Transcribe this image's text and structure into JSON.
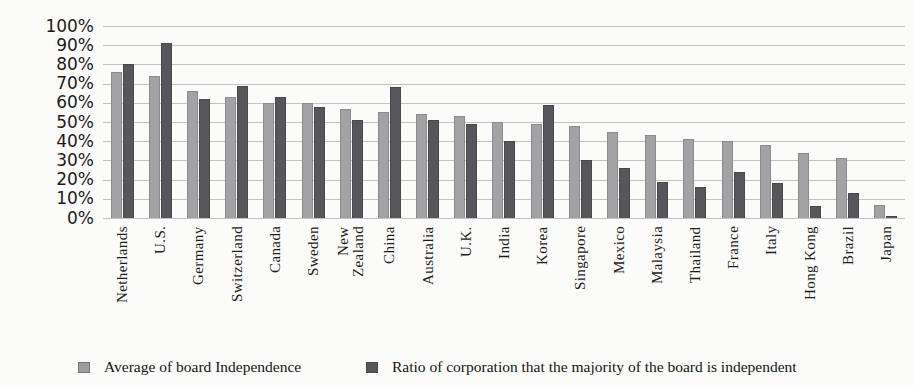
{
  "chart_data": {
    "type": "bar",
    "title": "",
    "xlabel": "",
    "ylabel": "",
    "ylim": [
      0,
      100
    ],
    "grid": "horizontal",
    "legend_position": "bottom",
    "yticks": [
      {
        "v": 0,
        "label": "0%"
      },
      {
        "v": 10,
        "label": "10%"
      },
      {
        "v": 20,
        "label": "20%"
      },
      {
        "v": 30,
        "label": "30%"
      },
      {
        "v": 40,
        "label": "40%"
      },
      {
        "v": 50,
        "label": "50%"
      },
      {
        "v": 60,
        "label": "60%"
      },
      {
        "v": 70,
        "label": "70%"
      },
      {
        "v": 80,
        "label": "80%"
      },
      {
        "v": 90,
        "label": "90%"
      },
      {
        "v": 100,
        "label": "100%"
      }
    ],
    "categories": [
      "Netherlands",
      "U.S.",
      "Germany",
      "Switzerland",
      "Canada",
      "Sweden",
      "New\nZealand",
      "China",
      "Australia",
      "U.K.",
      "India",
      "Korea",
      "Singapore",
      "Mexico",
      "Malaysia",
      "Thailand",
      "France",
      "Italy",
      "Hong Kong",
      "Brazil",
      "Japan"
    ],
    "series": [
      {
        "name": "Average of board Independence",
        "color": "#a3a3a6",
        "values": [
          76,
          74,
          66,
          63,
          60,
          60,
          57,
          55,
          54,
          53,
          50,
          49,
          48,
          45,
          43,
          41,
          40,
          38,
          34,
          31,
          7
        ]
      },
      {
        "name": "Ratio of corporation that the majority of the board is independent",
        "color": "#57575b",
        "values": [
          80,
          91,
          62,
          69,
          63,
          58,
          51,
          68,
          51,
          49,
          40,
          59,
          30,
          26,
          19,
          16,
          24,
          18,
          6,
          13,
          1
        ]
      }
    ]
  }
}
